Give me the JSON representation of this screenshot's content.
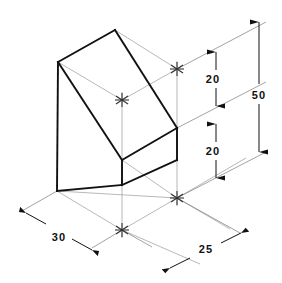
{
  "drawing": {
    "title": "Isometric wedge block dimensioned drawing",
    "type": "isometric-technical-drawing",
    "colors": {
      "background": "#ffffff",
      "object_line": "#111111",
      "construction_line": "#9a9a9a",
      "dimension_line": "#555555",
      "text": "#111111"
    },
    "dimensions": [
      {
        "id": "height-upper",
        "value": "20",
        "label_x": 213,
        "label_y": 79
      },
      {
        "id": "height-lower",
        "value": "20",
        "label_x": 213,
        "label_y": 154
      },
      {
        "id": "height-overall",
        "value": "50",
        "label_x": 256,
        "label_y": 96
      },
      {
        "id": "depth-left",
        "value": "30",
        "label_x": 54,
        "label_y": 238
      },
      {
        "id": "width-right",
        "value": "25",
        "label_x": 198,
        "label_y": 249
      }
    ],
    "vertices": {
      "top_apex": {
        "x": 115,
        "y": 30
      },
      "left_top": {
        "x": 58,
        "y": 62
      },
      "right_top": {
        "x": 177,
        "y": 69
      },
      "front_mid": {
        "x": 122,
        "y": 100
      },
      "left_bottom": {
        "x": 57,
        "y": 191
      },
      "front_bottom": {
        "x": 122,
        "y": 160
      },
      "right_bottom": {
        "x": 177,
        "y": 128
      },
      "right_lower": {
        "x": 177,
        "y": 160
      },
      "front_base": {
        "x": 122,
        "y": 230
      },
      "right_base": {
        "x": 177,
        "y": 198
      }
    },
    "center_marks": [
      {
        "id": "mark-top-front",
        "x": 122,
        "y": 100
      },
      {
        "id": "mark-top-right",
        "x": 177,
        "y": 69
      },
      {
        "id": "mark-base-front",
        "x": 122,
        "y": 230
      },
      {
        "id": "mark-base-right",
        "x": 177,
        "y": 198
      }
    ]
  }
}
